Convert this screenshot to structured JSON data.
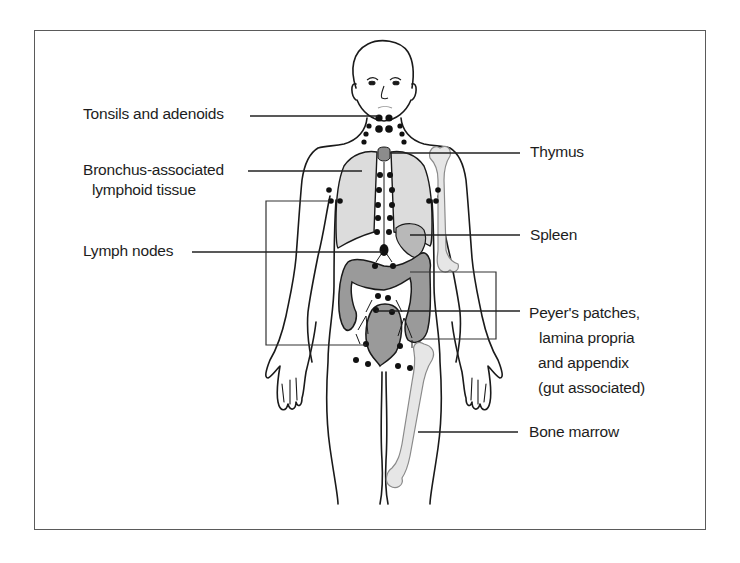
{
  "figure": {
    "type": "anatomical-diagram"
  },
  "colors": {
    "outline": "#1a1a1a",
    "frame": "#5a5a5a",
    "lung_fill": "#dcdcdc",
    "gut_fill": "#9a9a9a",
    "bone_fill": "#e6e6e6",
    "thymus_fill": "#8c8c8c",
    "spleen_fill": "#b8b8b8",
    "node_fill": "#111111",
    "leader_line": "#222222"
  },
  "labels": {
    "left": [
      {
        "id": "tonsils",
        "lines": [
          "Tonsils and adenoids"
        ]
      },
      {
        "id": "balt",
        "lines": [
          "Bronchus-associated",
          "lymphoid tissue"
        ]
      },
      {
        "id": "lymph_nodes",
        "lines": [
          "Lymph nodes"
        ]
      }
    ],
    "right": [
      {
        "id": "thymus",
        "lines": [
          "Thymus"
        ]
      },
      {
        "id": "spleen",
        "lines": [
          "Spleen"
        ]
      },
      {
        "id": "galt",
        "lines": [
          "Peyer's patches,",
          "lamina propria",
          "and appendix",
          "(gut associated)"
        ]
      },
      {
        "id": "bone_marrow",
        "lines": [
          "Bone marrow"
        ]
      }
    ]
  }
}
